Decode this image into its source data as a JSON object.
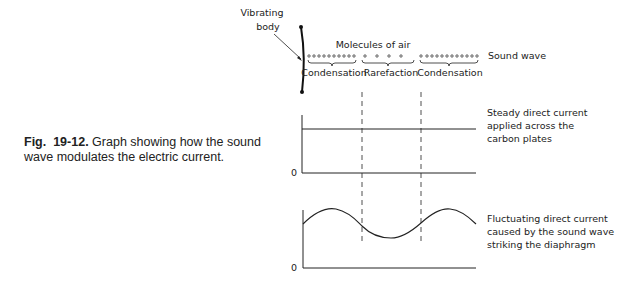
{
  "caption": {
    "fig_prefix": "Fig.",
    "fig_number": "19-12.",
    "text": "Graph showing how the sound wave modulates the electric current."
  },
  "top": {
    "vibrating_body_line1": "Vibrating",
    "vibrating_body_line2": "body",
    "molecules_label": "Molecules of air",
    "sound_wave_label": "Sound wave",
    "regions": [
      "Condensation",
      "Rarefaction",
      "Condensation"
    ]
  },
  "graph1": {
    "zero_label": "0",
    "label_lines": [
      "Steady direct current",
      "applied across the",
      "carbon plates"
    ]
  },
  "graph2": {
    "zero_label": "0",
    "label_lines": [
      "Fluctuating direct current",
      "caused by the sound wave",
      "striking the diaphragm"
    ]
  },
  "colors": {
    "ink": "#222222",
    "background": "#ffffff"
  }
}
